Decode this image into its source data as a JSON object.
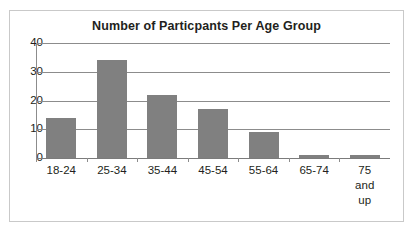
{
  "chart_data": {
    "type": "bar",
    "title": "Number of Particpants Per Age Group",
    "xlabel": "",
    "ylabel": "",
    "categories": [
      "18-24",
      "25-34",
      "35-44",
      "45-54",
      "55-64",
      "65-74",
      "75 and up"
    ],
    "values": [
      14,
      34,
      22,
      17,
      9,
      1,
      1
    ],
    "ylim": [
      0,
      40
    ],
    "yticks": [
      0,
      10,
      20,
      30,
      40
    ],
    "ytick_labels": [
      "0",
      "10",
      "20",
      "30",
      "40"
    ],
    "grid": true,
    "legend": false,
    "series": [
      {
        "name": "Participants",
        "values": [
          14,
          34,
          22,
          17,
          9,
          1,
          1
        ]
      }
    ],
    "colors": {
      "bar_fill": "#808080",
      "gridline": "#8c8c8c",
      "axis": "#8c8c8c",
      "text": "#231f20",
      "frame_border": "#c9c9c9",
      "background": "#ffffff"
    }
  },
  "category_label_lines": [
    [
      "18-24"
    ],
    [
      "25-34"
    ],
    [
      "35-44"
    ],
    [
      "45-54"
    ],
    [
      "55-64"
    ],
    [
      "65-74"
    ],
    [
      "75",
      "and",
      "up"
    ]
  ]
}
